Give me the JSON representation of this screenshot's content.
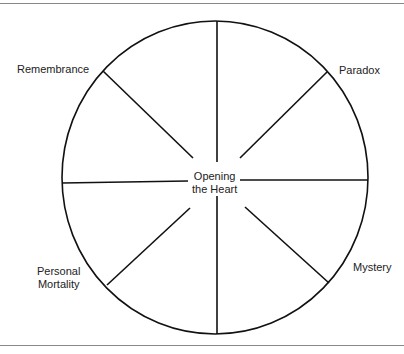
{
  "diagram": {
    "title": "",
    "center_label": [
      "Opening",
      "the Heart"
    ],
    "labels": {
      "top_left": "Remembrance",
      "top_right": "Paradox",
      "bottom_left": [
        "Personal",
        "Mortality"
      ],
      "bottom_right": "Mystery"
    },
    "segments": 8
  }
}
